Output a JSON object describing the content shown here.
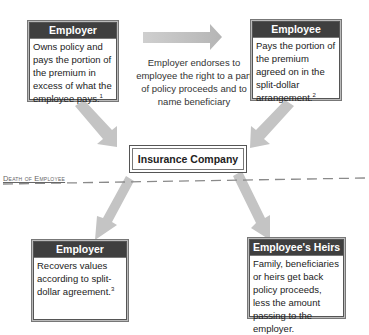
{
  "boxes": {
    "employer_top": {
      "title": "Employer",
      "text": "Owns policy and pays the portion of the premium in excess of what the employee pays.",
      "footnote": "1"
    },
    "employee_top": {
      "title": "Employee",
      "text": "Pays the portion of the premium agreed on in the split-dollar arrangement.",
      "footnote": "2"
    },
    "insurance_company": {
      "title": "Insurance Company"
    },
    "employer_bottom": {
      "title": "Employer",
      "text": "Recovers values according to split-dollar agreement.",
      "footnote": "3"
    },
    "employee_heirs": {
      "title": "Employee's Heirs",
      "text": "Family, beneficiaries or heirs get back policy proceeds, less the amount passing to the employer."
    }
  },
  "arrow_caption": "Employer endorses to employee the right to a part of policy proceeds and to name beneficiary",
  "divider_label": "Death of Employee",
  "colors": {
    "header_bg": "#3f3f3f",
    "arrow_fill": "#bdbdbd",
    "divider": "#888888"
  }
}
